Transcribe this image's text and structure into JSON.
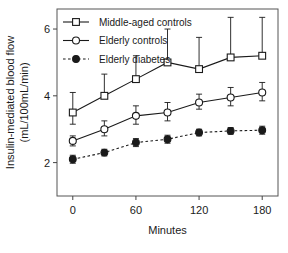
{
  "chart_data": {
    "type": "line",
    "title": "",
    "xlabel": "Minutes",
    "ylabel": "Insulin-mediated blood flow (mL/100mL/min)",
    "ylabel_line1": "Insulin-mediated blood flow",
    "ylabel_line2": "(mL/100mL/min)",
    "x": [
      0,
      30,
      60,
      90,
      120,
      150,
      180
    ],
    "xticks": [
      0,
      60,
      120,
      180
    ],
    "xticklabels": [
      "0",
      "60",
      "120",
      "180"
    ],
    "yticks": [
      2,
      4,
      6
    ],
    "yticklabels": [
      "2",
      "4",
      "6"
    ],
    "xlim": [
      -15,
      195
    ],
    "ylim": [
      1.0,
      6.6
    ],
    "grid": false,
    "legend_position": "top-left",
    "series": [
      {
        "name": "Middle-aged controls",
        "marker": "open-square",
        "line": "solid",
        "color": "#1a1a1a",
        "values": [
          3.5,
          4.0,
          4.5,
          5.0,
          4.8,
          5.15,
          5.2
        ],
        "err_upper": [
          0.6,
          0.65,
          0.7,
          1.0,
          0.95,
          1.2,
          1.15
        ],
        "err_lower": [
          0.35,
          0.0,
          0.0,
          0.0,
          0.0,
          0.0,
          0.0
        ]
      },
      {
        "name": "Elderly controls",
        "marker": "open-circle",
        "line": "solid",
        "color": "#1a1a1a",
        "values": [
          2.65,
          3.0,
          3.4,
          3.5,
          3.8,
          3.95,
          4.1
        ],
        "err_upper": [
          0.15,
          0.25,
          0.3,
          0.3,
          0.25,
          0.3,
          0.3
        ],
        "err_lower": [
          0.15,
          0.2,
          0.25,
          0.25,
          0.2,
          0.25,
          0.25
        ]
      },
      {
        "name": "Elderly diabetes",
        "marker": "filled-circle",
        "line": "dashed",
        "color": "#1a1a1a",
        "values": [
          2.1,
          2.3,
          2.6,
          2.7,
          2.9,
          2.95,
          2.97
        ],
        "err_upper": [
          0.12,
          0.1,
          0.12,
          0.12,
          0.1,
          0.1,
          0.12
        ],
        "err_lower": [
          0.12,
          0.1,
          0.12,
          0.12,
          0.1,
          0.1,
          0.12
        ]
      }
    ]
  },
  "legend": {
    "items": [
      {
        "label": "Middle-aged controls"
      },
      {
        "label": "Elderly controls"
      },
      {
        "label": "Elderly diabetes"
      }
    ]
  }
}
